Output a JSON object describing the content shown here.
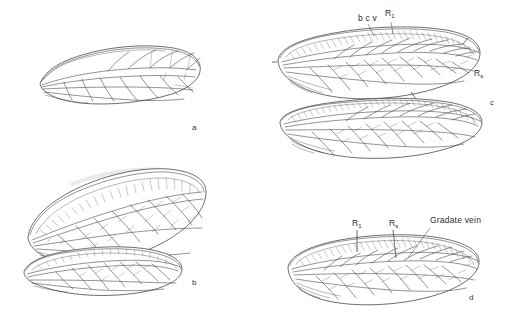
{
  "figure": {
    "background_color": "#ffffff",
    "line_color": "#3a3a3a"
  },
  "panels": [
    {
      "id": "a",
      "letter": "a",
      "letter_x": 193,
      "letter_y": 129,
      "caption": "Simple elongate wing with sparse venation",
      "wing_type": "forewing",
      "labels": []
    },
    {
      "id": "b",
      "letter": "b",
      "letter_x": 193,
      "letter_y": 284,
      "caption": "Broad forewing and hindwing with dense costal crossveins",
      "wing_type": "forewing-and-hindwing",
      "labels": []
    },
    {
      "id": "c",
      "letter": "c",
      "letter_x": 491,
      "letter_y": 104,
      "caption": "Forewing and hindwing with costal crossveins and radial sector",
      "wing_type": "forewing-and-hindwing",
      "labels": [
        {
          "text": "b c v",
          "name": "label-bcv",
          "x": 362,
          "y": 20
        },
        {
          "text": "R",
          "sub": "1",
          "name": "label-r1",
          "x": 386,
          "y": 14
        },
        {
          "text": "R",
          "sub": "s",
          "name": "label-rs",
          "x": 475,
          "y": 74
        }
      ]
    },
    {
      "id": "d",
      "letter": "d",
      "letter_x": 470,
      "letter_y": 299,
      "caption": "Wing showing gradate vein series",
      "wing_type": "forewing",
      "labels": [
        {
          "text": "R",
          "sub": "1",
          "name": "label-r1",
          "x": 355,
          "y": 224
        },
        {
          "text": "R",
          "sub": "s",
          "name": "label-rs",
          "x": 391,
          "y": 224
        },
        {
          "text": "Gradate vein",
          "name": "label-gradate-vein",
          "x": 432,
          "y": 221
        }
      ]
    }
  ],
  "vein_terms": {
    "bcv": "basal costal crossveins",
    "R1": "radius one",
    "Rs": "radial sector",
    "gradate_vein": "gradate vein series"
  }
}
